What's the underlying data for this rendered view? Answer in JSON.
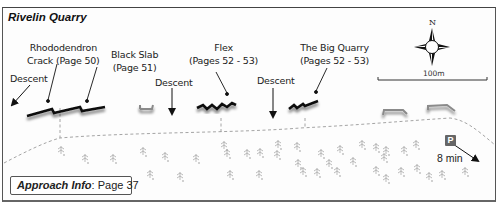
{
  "map": {
    "title": "Rivelin Quarry",
    "labels": {
      "descent_left": "Descent",
      "rhododendron_line1": "Rhododendron",
      "rhododendron_line2": "Crack (Page 50)",
      "black_slab_line1": "Black Slab",
      "black_slab_line2": "(Page 51)",
      "descent_mid": "Descent",
      "flex_line1": "Flex",
      "flex_line2": "(Pages 52 - 53)",
      "descent_right": "Descent",
      "big_quarry_line1": "The Big Quarry",
      "big_quarry_line2": "(Pages 52 - 53)"
    },
    "compass": {
      "north_label": "N",
      "icon": "compass-rose-icon"
    },
    "scale": {
      "label": "100m"
    },
    "parking": {
      "label": "P",
      "walk_time": "8 min",
      "icon": "parking-icon"
    },
    "approach": {
      "label": "Approach Info",
      "value": ": Page 37"
    },
    "colors": {
      "crag": "#111111",
      "building": "#888888",
      "path": "#9a9a9a",
      "tree": "#bbbbbb",
      "frame": "#555555"
    }
  }
}
